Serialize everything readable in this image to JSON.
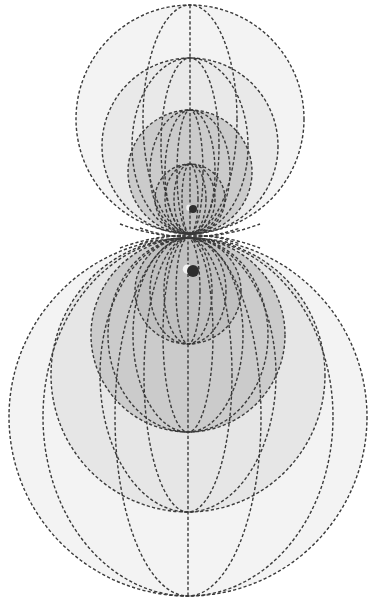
{
  "diagram": {
    "colors": {
      "background": "#ffffff",
      "stroke": "#3a3a3a",
      "fill_outer": "#f3f3f3",
      "fill_second": "#e6e6e6",
      "fill_third": "#cbcbcb",
      "fill_inner": "#bfbfbf",
      "particle": "#2e2e2e"
    },
    "upper_group": {
      "axis": {
        "x": 190,
        "y1": 5,
        "y2": 234
      },
      "circles": [
        {
          "cx": 190,
          "cy": 119,
          "r": 114,
          "fill": "#f3f3f3"
        },
        {
          "cx": 190,
          "cy": 146,
          "r": 88,
          "fill": "#e9e9e9"
        },
        {
          "cx": 190,
          "cy": 172,
          "r": 62,
          "fill": "#cbcbcb"
        },
        {
          "cx": 190,
          "cy": 199,
          "r": 35,
          "fill": "#c0c0c0"
        }
      ],
      "ellipses": [
        {
          "cx": 190,
          "cy": 119,
          "rx": 47,
          "ry": 114
        },
        {
          "cx": 190,
          "cy": 146,
          "rx": 29,
          "ry": 88
        },
        {
          "cx": 190,
          "cy": 146,
          "rx": 58,
          "ry": 88
        },
        {
          "cx": 190,
          "cy": 172,
          "rx": 13,
          "ry": 62
        },
        {
          "cx": 190,
          "cy": 172,
          "rx": 25,
          "ry": 62
        },
        {
          "cx": 190,
          "cy": 172,
          "rx": 40,
          "ry": 62
        },
        {
          "cx": 190,
          "cy": 199,
          "rx": 8,
          "ry": 35
        },
        {
          "cx": 190,
          "cy": 199,
          "rx": 16,
          "ry": 35
        },
        {
          "cx": 190,
          "cy": 199,
          "rx": 25,
          "ry": 35
        }
      ],
      "particle": {
        "cx": 193,
        "cy": 209,
        "r": 4
      }
    },
    "lower_group": {
      "axis": {
        "x": 188,
        "y1": 236,
        "y2": 596
      },
      "circles": [
        {
          "cx": 188,
          "cy": 417,
          "r": 179,
          "fill": "#f3f3f3"
        },
        {
          "cx": 188,
          "cy": 375,
          "r": 137,
          "fill": "#e6e6e6"
        },
        {
          "cx": 188,
          "cy": 335,
          "r": 97,
          "fill": "#cbcbcb"
        },
        {
          "cx": 188,
          "cy": 291,
          "r": 53,
          "fill": "#c0c0c0"
        }
      ],
      "ellipses": [
        {
          "cx": 188,
          "cy": 417,
          "rx": 73,
          "ry": 179
        },
        {
          "cx": 188,
          "cy": 417,
          "rx": 145,
          "ry": 179
        },
        {
          "cx": 188,
          "cy": 375,
          "rx": 44,
          "ry": 137
        },
        {
          "cx": 188,
          "cy": 375,
          "rx": 88,
          "ry": 137
        },
        {
          "cx": 188,
          "cy": 335,
          "rx": 25,
          "ry": 97
        },
        {
          "cx": 188,
          "cy": 335,
          "rx": 55,
          "ry": 97
        },
        {
          "cx": 188,
          "cy": 335,
          "rx": 80,
          "ry": 97
        },
        {
          "cx": 188,
          "cy": 291,
          "rx": 12,
          "ry": 53
        },
        {
          "cx": 188,
          "cy": 291,
          "rx": 24,
          "ry": 53
        },
        {
          "cx": 188,
          "cy": 291,
          "rx": 38,
          "ry": 53
        }
      ],
      "particle": {
        "cx": 193,
        "cy": 271,
        "r": 6
      }
    },
    "crossing_lines": [
      {
        "d": "M 120 224 Q 190 250 260 224"
      },
      {
        "d": "M 120 248 Q 190 222 260 248"
      },
      {
        "d": "M 140 228 Q 190 246 240 228"
      },
      {
        "d": "M 140 244 Q 190 226 240 244"
      }
    ]
  }
}
